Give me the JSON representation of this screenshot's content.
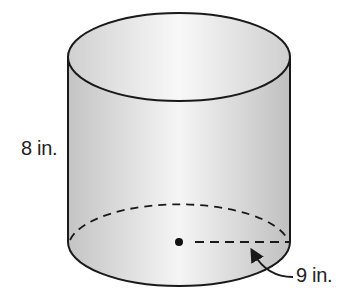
{
  "figure": {
    "shape": "cylinder",
    "height_label": "8 in.",
    "radius_label": "9 in.",
    "colors": {
      "stroke": "#1a1a1a",
      "fill_light": "#f4f4f4",
      "fill_dark": "#c8c8c8"
    }
  }
}
